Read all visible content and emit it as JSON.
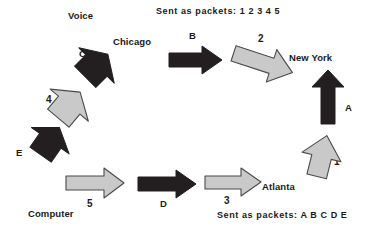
{
  "diagram": {
    "title_voice": "Voice",
    "title_computer": "Computer",
    "nodes": [
      {
        "id": "chicago",
        "label": "Chicago"
      },
      {
        "id": "new-york",
        "label": "New York"
      },
      {
        "id": "atlanta",
        "label": "Atlanta"
      }
    ],
    "captions": [
      {
        "id": "top-packets",
        "prefix": "Sent as packets:",
        "sequence": "1 2 3 4 5",
        "full": "Sent as packets:  1 2 3 4 5"
      },
      {
        "id": "bottom-packets",
        "prefix": "Sent as packets:",
        "sequence": "A B C D E",
        "full": "Sent as packets:  A B C D E"
      }
    ],
    "colors": {
      "voice_arrow_fill": "#231f20",
      "data_arrow_fill": "#c9c9c9",
      "arrow_stroke": "#3b3b3b",
      "text": "#1a1a1a",
      "background": "#ffffff"
    },
    "arrows": [
      {
        "id": "arrow-a",
        "label": "A",
        "kind": "voice",
        "style": "dark",
        "direction": "up"
      },
      {
        "id": "arrow-b",
        "label": "B",
        "kind": "voice",
        "style": "dark",
        "direction": "right"
      },
      {
        "id": "arrow-c",
        "label": "C",
        "kind": "voice",
        "style": "dark",
        "direction": "up-right"
      },
      {
        "id": "arrow-d",
        "label": "D",
        "kind": "voice",
        "style": "dark",
        "direction": "right"
      },
      {
        "id": "arrow-e",
        "label": "E",
        "kind": "voice",
        "style": "dark",
        "direction": "up-right"
      },
      {
        "id": "arrow-1",
        "label": "1",
        "kind": "data",
        "style": "gray",
        "direction": "up"
      },
      {
        "id": "arrow-2",
        "label": "2",
        "kind": "data",
        "style": "gray",
        "direction": "down-right"
      },
      {
        "id": "arrow-3",
        "label": "3",
        "kind": "data",
        "style": "gray",
        "direction": "right"
      },
      {
        "id": "arrow-4",
        "label": "4",
        "kind": "data",
        "style": "gray",
        "direction": "up-right"
      },
      {
        "id": "arrow-5",
        "label": "5",
        "kind": "data",
        "style": "gray",
        "direction": "right"
      }
    ]
  }
}
